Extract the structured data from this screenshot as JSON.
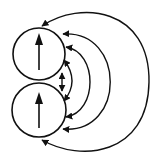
{
  "diagram": {
    "title": "Two aligned dipoles with field lines",
    "stroke_color": "#111111",
    "background": "#ffffff",
    "dipoles": [
      {
        "id": "top",
        "cx": 39,
        "cy": 54,
        "r": 26,
        "moment_direction": "up"
      },
      {
        "id": "bottom",
        "cx": 39,
        "cy": 110,
        "r": 27,
        "moment_direction": "up"
      }
    ],
    "field_lines": [
      {
        "id": "inner-double-arrow",
        "type": "segment",
        "from": [
          62,
          72
        ],
        "to": [
          62,
          92
        ],
        "arrows": "both"
      },
      {
        "id": "arc-1",
        "type": "arc",
        "from_bottom": [
          68,
          102
        ],
        "to_top": [
          68,
          58
        ],
        "extent_x": 76,
        "arrows": "into-both-circles"
      },
      {
        "id": "arc-2",
        "type": "arc",
        "from_bottom": [
          70,
          118
        ],
        "to_top": [
          70,
          45
        ],
        "extent_x": 93,
        "arrows": "into-both-circles"
      },
      {
        "id": "arc-3",
        "type": "arc",
        "from_bottom": [
          64,
          129
        ],
        "to_top": [
          64,
          33
        ],
        "extent_x": 116,
        "arrows": "into-both-circles"
      },
      {
        "id": "arc-4",
        "type": "arc",
        "from_bottom": [
          42,
          141
        ],
        "to_top": [
          42,
          25
        ],
        "extent_x": 149,
        "arrows": "into-both-circles"
      }
    ]
  }
}
